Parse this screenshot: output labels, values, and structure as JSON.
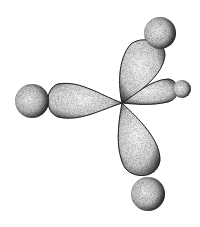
{
  "image": {
    "description": "Stippled illustration of four orbital lobes radiating from a central point, each capped by a sphere",
    "background": "#ffffff",
    "ink": "#111111",
    "center": [
      122,
      103
    ],
    "lobes": [
      {
        "name": "left",
        "tip": [
          48,
          100
        ],
        "sphere": [
          32,
          101,
          17
        ]
      },
      {
        "name": "upper",
        "tip": [
          148,
          42
        ],
        "sphere": [
          159,
          33,
          16
        ]
      },
      {
        "name": "right",
        "tip": [
          172,
          88
        ],
        "sphere": [
          180,
          88,
          10
        ]
      },
      {
        "name": "lower",
        "tip": [
          147,
          180
        ],
        "sphere": [
          148,
          194,
          17
        ]
      }
    ]
  }
}
